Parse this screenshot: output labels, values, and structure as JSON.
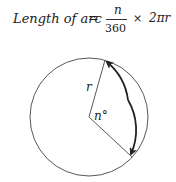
{
  "formula": {
    "lhs": "Length of arc",
    "equals": "=",
    "numerator": "n",
    "denominator": "360",
    "times": "×",
    "rhs": "2πr"
  },
  "diagram": {
    "radius_label": "r",
    "angle_label": "n°",
    "circle": {
      "cx": 89,
      "cy": 117,
      "r": 59
    },
    "stroke_color": "#333333"
  }
}
